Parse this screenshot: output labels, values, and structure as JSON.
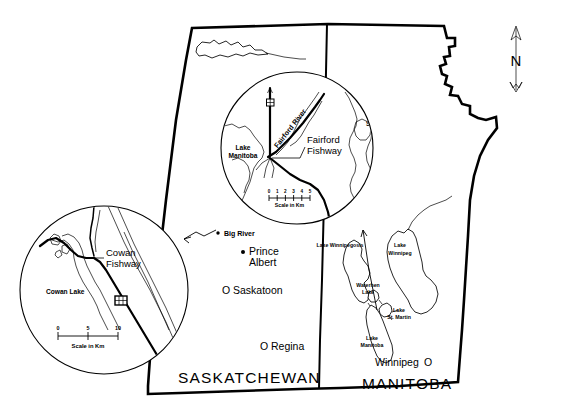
{
  "figure": {
    "type": "map",
    "background_color": "#ffffff",
    "line_color": "#000000"
  },
  "provinces": [
    {
      "name": "SASKATCHEWAN",
      "label": "SASKATCHEWAN"
    },
    {
      "name": "MANITOBA",
      "label": "MANITOBA"
    }
  ],
  "cities": [
    {
      "label": "Big River",
      "marker": "small-filled-dot"
    },
    {
      "label": "Prince Albert",
      "marker": "filled-dot"
    },
    {
      "label": "Saskatoon",
      "marker": "open-circle"
    },
    {
      "label": "Regina",
      "marker": "open-circle"
    },
    {
      "label": "Winnipeg",
      "marker": "open-circle"
    }
  ],
  "city_markers": {
    "open_circle_glyph": "O",
    "filled_dot_glyph": "●"
  },
  "main_map_lakes": [
    {
      "label": "Lake Winnipegosis"
    },
    {
      "label": "Lake Winnipeg",
      "line1": "Lake",
      "line2": "Winnipeg"
    },
    {
      "label": "Waterhen Lake",
      "line1": "Waterhen",
      "line2": "Lake"
    },
    {
      "label": "Lake St. Martin",
      "line1": "Lake",
      "line2": "St. Martin"
    },
    {
      "label": "Lake Manitoba",
      "line1": "Lake",
      "line2": "Manitoba"
    }
  ],
  "insets": [
    {
      "id": "fairford",
      "title": "Fairford Fishway",
      "title_line1": "Fairford",
      "title_line2": "Fishway",
      "position": "upper-right",
      "river_label": "Fairford River",
      "lakes": [
        {
          "label": "Lake Manitoba",
          "line1": "Lake",
          "line2": "Manitoba"
        },
        {
          "label": "Lake St. Martin",
          "line1": "Lake",
          "line2": "St. Martin"
        }
      ],
      "scale": {
        "caption": "Scale in Km",
        "ticks": [
          "0",
          "1",
          "2",
          "3",
          "4",
          "5"
        ],
        "min": 0,
        "max": 5,
        "units": "Km"
      }
    },
    {
      "id": "cowan",
      "title": "Cowan Fishway",
      "title_line1": "Cowan",
      "title_line2": "Fishway",
      "position": "lower-left",
      "lakes": [
        {
          "label": "Cowan Lake"
        }
      ],
      "scale": {
        "caption": "Scale in Km",
        "ticks": [
          "0",
          "5",
          "10"
        ],
        "min": 0,
        "max": 10,
        "units": "Km"
      }
    }
  ],
  "compass": {
    "label": "N",
    "name": "north-arrow"
  }
}
